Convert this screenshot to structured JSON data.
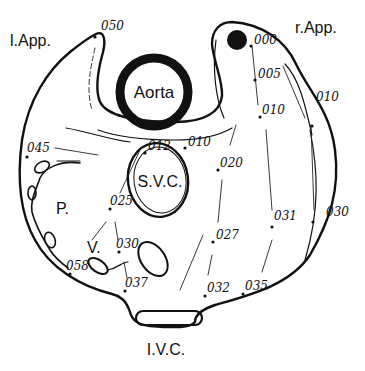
{
  "figure": {
    "structures": {
      "left_appendage": "l.App.",
      "right_appendage": "r.App.",
      "aorta": "Aorta",
      "svc": "S.V.C.",
      "ivc": "I.V.C.",
      "pulmonary": "P.",
      "vessel": "V."
    },
    "timing_labels": [
      {
        "id": "050",
        "text": "050"
      },
      {
        "id": "000",
        "text": "000"
      },
      {
        "id": "005",
        "text": "005"
      },
      {
        "id": "010a",
        "text": "010"
      },
      {
        "id": "010b",
        "text": "010"
      },
      {
        "id": "010c",
        "text": "010"
      },
      {
        "id": "012",
        "text": "012"
      },
      {
        "id": "020",
        "text": "020"
      },
      {
        "id": "025",
        "text": "025"
      },
      {
        "id": "027",
        "text": "027"
      },
      {
        "id": "030a",
        "text": "030"
      },
      {
        "id": "030b",
        "text": "030"
      },
      {
        "id": "031",
        "text": "031"
      },
      {
        "id": "032",
        "text": "032"
      },
      {
        "id": "035",
        "text": "035"
      },
      {
        "id": "037",
        "text": "037"
      },
      {
        "id": "045",
        "text": "045"
      },
      {
        "id": "058",
        "text": "058"
      }
    ],
    "colors": {
      "ink": "#111111",
      "background": "#ffffff"
    }
  }
}
